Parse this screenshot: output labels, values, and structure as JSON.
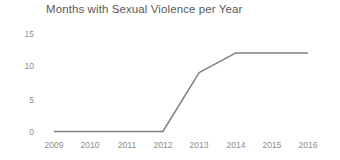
{
  "chart_data": {
    "type": "line",
    "title": "Months with Sexual Violence per Year",
    "xlabel": "",
    "ylabel": "",
    "categories": [
      "2009",
      "2010",
      "2011",
      "2012",
      "2013",
      "2014",
      "2015",
      "2016"
    ],
    "x": [
      2009,
      2010,
      2011,
      2012,
      2013,
      2014,
      2015,
      2016
    ],
    "values": [
      0,
      0,
      0,
      0,
      9,
      12,
      12,
      12
    ],
    "series": [
      {
        "name": "Months with Sexual Violence",
        "values": [
          0,
          0,
          0,
          0,
          9,
          12,
          12,
          12
        ]
      }
    ],
    "ylim": [
      0,
      15
    ],
    "y_ticks": [
      "0",
      "5",
      "10",
      "15"
    ],
    "y_tick_values": [
      0,
      5,
      10,
      15
    ],
    "grid": false,
    "legend": "none",
    "line_color": "#808080",
    "title_color": "#595959",
    "tick_color": "#8c8c8c",
    "background_color": "#ffffff"
  }
}
